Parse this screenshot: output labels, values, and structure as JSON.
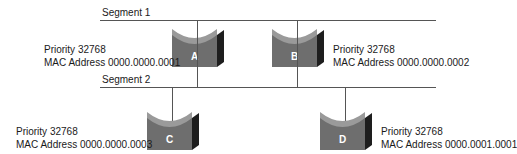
{
  "diagram": {
    "segments": [
      {
        "label": "Segment 1"
      },
      {
        "label": "Segment 2"
      }
    ],
    "switches": [
      {
        "id": "A",
        "label": "A",
        "priority": "Priority 32768",
        "mac": "MAC Address 0000.0000.0001",
        "segment": "Segment 1"
      },
      {
        "id": "B",
        "label": "B",
        "priority": "Priority 32768",
        "mac": "MAC Address 0000.0000.0002",
        "segment": "Segment 1"
      },
      {
        "id": "C",
        "label": "C",
        "priority": "Priority 32768",
        "mac": "MAC Address 0000.0000.0003",
        "segment": "Segment 2"
      },
      {
        "id": "D",
        "label": "D",
        "priority": "Priority 32768",
        "mac": "MAC Address 0000.0001.0001",
        "segment": "Segment 2"
      }
    ],
    "colors": {
      "switch_top": "#8f8f8f",
      "switch_front": "#6e6e6e",
      "switch_side": "#1e1e1e",
      "line": "#555555"
    }
  }
}
